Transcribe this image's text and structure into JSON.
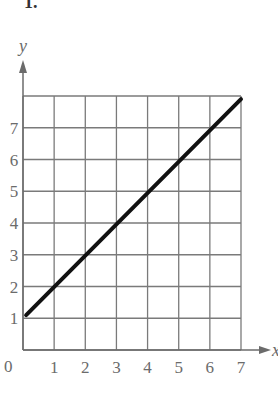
{
  "problem_label": "1.",
  "chart_data": {
    "type": "line",
    "title": "",
    "xlabel": "x",
    "ylabel": "y",
    "xlim": [
      0,
      7
    ],
    "ylim": [
      0,
      8
    ],
    "grid": true,
    "origin_label": "0",
    "x_ticks": [
      "1",
      "2",
      "3",
      "4",
      "5",
      "6",
      "7"
    ],
    "y_ticks": [
      "1",
      "2",
      "3",
      "4",
      "5",
      "6",
      "7"
    ],
    "series": [
      {
        "name": "line",
        "x": [
          0.1,
          7
        ],
        "y": [
          1.1,
          7.9
        ],
        "equation": "y = x + 1",
        "color": "#111111"
      }
    ]
  },
  "colors": {
    "grid": "#7a7a7a",
    "axis": "#6b6b6b",
    "line": "#111111",
    "text": "#6b6b6b"
  }
}
